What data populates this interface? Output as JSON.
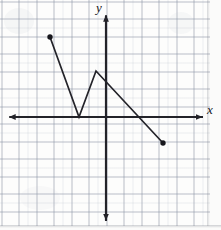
{
  "figure": {
    "kind": "coordinate-plane-graph",
    "background": "graph-paper",
    "width": 221,
    "height": 230,
    "ink_color": "#232329",
    "paper_color": "#fdfdfc",
    "grid_color": "#7b8394"
  },
  "axes": {
    "x_label": "x",
    "y_label": "y",
    "x_axis": {
      "pixel_y": 117,
      "pixel_x_start": 8,
      "pixel_x_end": 203,
      "arrows": "both"
    },
    "y_axis": {
      "pixel_x": 106,
      "pixel_y_start": 14,
      "pixel_y_end": 222,
      "arrows": "both"
    },
    "origin_pixel": [
      106,
      117
    ],
    "unit_pixels": 17.5,
    "xlim": [
      -5.6,
      5.5
    ],
    "ylim": [
      -6.0,
      5.9
    ],
    "grid": true,
    "tick_labels": []
  },
  "chart_data": {
    "type": "line",
    "title": "",
    "xlabel": "x",
    "ylabel": "y",
    "xlim": [
      -5.6,
      5.5
    ],
    "ylim": [
      -6.0,
      5.9
    ],
    "grid": true,
    "legend": "none",
    "series": [
      {
        "name": "piecewise-path",
        "x": [
          -3.2,
          -1.5,
          -0.6,
          3.3
        ],
        "y": [
          4.6,
          0.0,
          2.6,
          -1.5
        ],
        "pixel_points": [
          [
            50,
            37
          ],
          [
            79,
            117
          ],
          [
            96,
            71
          ],
          [
            163,
            143
          ]
        ],
        "endpoints_marked": [
          "closed-dot",
          "closed-dot"
        ],
        "color": "#232329"
      }
    ],
    "annotations": []
  },
  "markers": [
    {
      "name": "left-endpoint",
      "pixel": [
        50,
        37
      ],
      "value": [
        -3.2,
        4.6
      ],
      "style": "filled-circle"
    },
    {
      "name": "right-endpoint",
      "pixel": [
        163,
        143
      ],
      "value": [
        3.3,
        -1.5
      ],
      "style": "filled-circle"
    }
  ]
}
